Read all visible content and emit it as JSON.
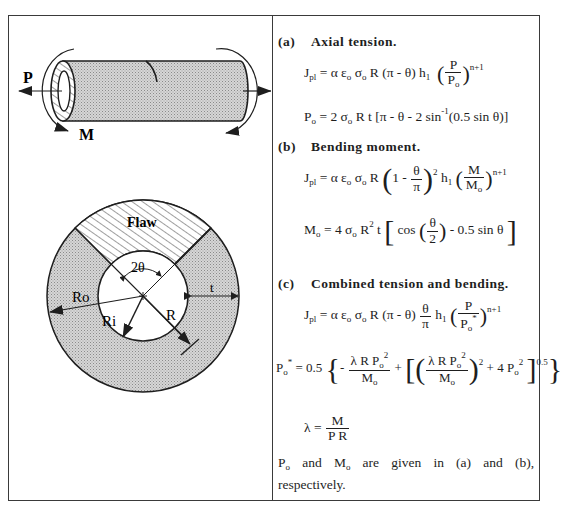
{
  "figure": {
    "cylinder": {
      "load_labels": {
        "tension": "P",
        "moment": "M"
      }
    },
    "cross_section": {
      "labels": {
        "flaw": "Flaw",
        "angle": "2θ",
        "outer_radius": "Ro",
        "inner_radius": "Ri",
        "mean_radius": "R",
        "thickness": "t"
      }
    }
  },
  "cases": [
    {
      "tag": "(a)",
      "title": "Axial tension.",
      "equations": {
        "jpl": "Jpl = α εo σo R (π - θ) h1 (P/Po)^(n+1)",
        "ref_load": "Po = 2 σo R t [π - θ - 2 sin^-1(0.5 sin θ)]"
      }
    },
    {
      "tag": "(b)",
      "title": "Bending moment.",
      "equations": {
        "jpl": "Jpl = α εo σo R (1 - θ/π)^2 h1 (M/Mo)^(n+1)",
        "ref_load": "Mo = 4 σo R^2 t [cos(θ/2) - 0.5 sin θ]"
      }
    },
    {
      "tag": "(c)",
      "title": "Combined tension and bending.",
      "equations": {
        "jpl": "Jpl = α εo σo R (π - θ) (θ/π) h1 (P/Po*)^(n+1)",
        "ref_load": "Po* = 0.5 {-λ R Po^2/Mo + [(λ R Po^2/Mo)^2 + 4 Po^2]^0.5}",
        "lambda": "λ = M/(P R)"
      }
    }
  ],
  "note": "Po and Mo are given in (a) and (b), respectively.",
  "text": {
    "a_tag": "(a)",
    "a_title": "Axial tension.",
    "b_tag": "(b)",
    "b_title": "Bending moment.",
    "c_tag": "(c)",
    "c_title": "Combined tension and bending.",
    "note_p": "P",
    "note_o1": "o",
    "note_and": "and",
    "note_m": "M",
    "note_o2": "o",
    "note_rest": "are given in (a) and (b), respectively."
  }
}
